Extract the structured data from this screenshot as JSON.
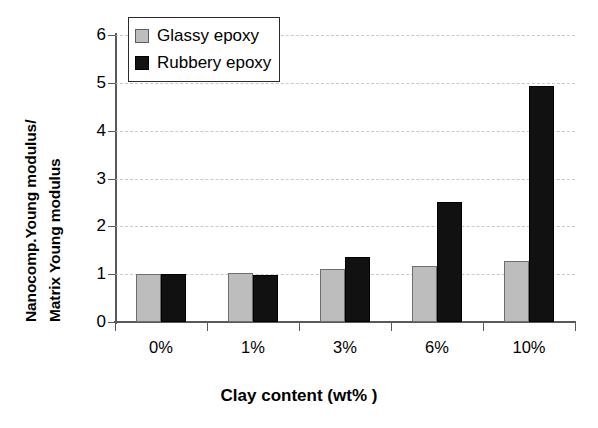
{
  "chart_data": {
    "type": "bar",
    "title": "",
    "xlabel": "Clay content (wt% )",
    "ylabel_line1": "Nanocomp.Young modulus/",
    "ylabel_line2": "Matrix Young modulus",
    "categories": [
      "0%",
      "1%",
      "3%",
      "6%",
      "10%"
    ],
    "series": [
      {
        "name": "Glassy epoxy",
        "color": "#bdbdbd",
        "values": [
          1.0,
          1.02,
          1.1,
          1.18,
          1.28
        ]
      },
      {
        "name": "Rubbery epoxy",
        "color": "#111111",
        "values": [
          1.0,
          0.99,
          1.36,
          2.5,
          4.93
        ]
      }
    ],
    "ylim": [
      0,
      6
    ],
    "yticks": [
      0,
      1,
      2,
      3,
      4,
      5,
      6
    ],
    "ytick_labels": [
      "0",
      "1",
      "2",
      "3",
      "4",
      "5",
      "6"
    ],
    "grid": true,
    "grid_axis": "y",
    "grid_style": "dashed",
    "legend_position": "top-left"
  }
}
